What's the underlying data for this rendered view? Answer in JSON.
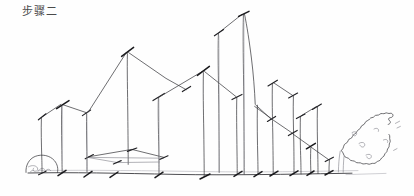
{
  "page": {
    "title": "步骤二",
    "title_meaning_label": "步骤二",
    "background_color": "#fefefe",
    "ink_color": "#3d3d42",
    "accent_tick_color": "#19191c",
    "light_ink_color": "#7d7d86",
    "width": 414,
    "height": 196
  },
  "drawing": {
    "name": "hand-drawn-architectural-massing-sketch",
    "medium_label": "pen-on-paper-sketch",
    "ground_line_y": 172,
    "elements": [
      {
        "name": "left-bush",
        "type": "bush",
        "cx": 42,
        "cy": 170,
        "rx": 17,
        "ry": 12
      },
      {
        "name": "building-1-low-left",
        "type": "building",
        "left": 40,
        "right": 62,
        "peak_x": 62,
        "peak_y": 114,
        "base_y": 172
      },
      {
        "name": "building-2-gable-small",
        "type": "building",
        "left": 62,
        "right": 90,
        "peak_x": 62,
        "peak_y": 110,
        "base_y": 172
      },
      {
        "name": "building-3-tall-gable",
        "type": "building",
        "left": 85,
        "right": 160,
        "peak_x": 127,
        "peak_y": 50,
        "base_y": 172
      },
      {
        "name": "building-4-mid-gable",
        "type": "building",
        "left": 157,
        "right": 215,
        "peak_x": 203,
        "peak_y": 70,
        "base_y": 172
      },
      {
        "name": "building-5-tower-left",
        "type": "tower",
        "left": 218,
        "right": 240,
        "peak_x": 218,
        "peak_y": 30,
        "base_y": 172
      },
      {
        "name": "building-6-tower-tallest",
        "type": "tower",
        "left": 240,
        "right": 272,
        "peak_x": 243,
        "peak_y": 11,
        "base_y": 172
      },
      {
        "name": "building-7-stepped-right",
        "type": "building",
        "left": 272,
        "right": 310,
        "peak_x": 274,
        "peak_y": 80,
        "base_y": 172
      },
      {
        "name": "building-8-stepped-lower",
        "type": "building",
        "left": 300,
        "right": 330,
        "peak_x": 303,
        "peak_y": 113,
        "base_y": 172
      },
      {
        "name": "building-9-small-right",
        "type": "building",
        "left": 326,
        "right": 345,
        "peak_x": 328,
        "peak_y": 145,
        "base_y": 172
      },
      {
        "name": "right-tree",
        "type": "tree",
        "cx": 368,
        "cy": 140
      },
      {
        "name": "foreground-roof-plane",
        "type": "plane",
        "left": 88,
        "right": 168,
        "apex_x": 132,
        "apex_y": 150
      }
    ],
    "tick_marks_count": 24,
    "ground_line_label": "ground-line"
  }
}
